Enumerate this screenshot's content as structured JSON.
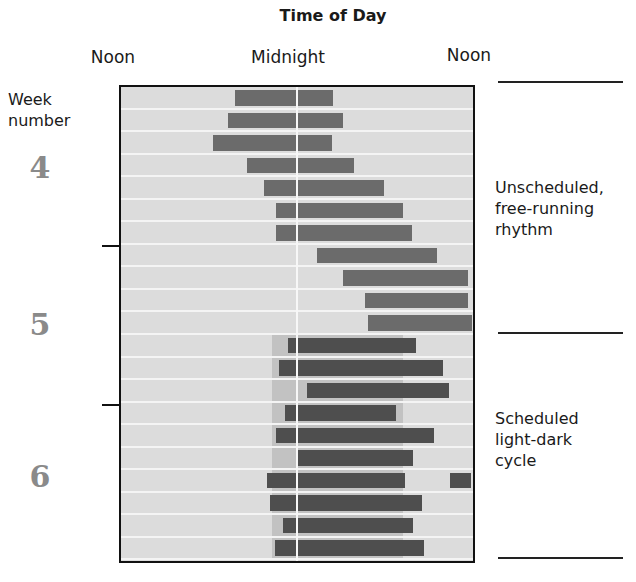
{
  "chart_data": {
    "type": "bar",
    "subtype": "actogram (horizontal range bars)",
    "title": "Time of Day",
    "xlabel": "Time of Day",
    "ylabel": "Week number",
    "x_unit": "hours after left-edge noon (0 = Noon, 12 = Midnight, 24 = Noon)",
    "xlim": [
      0,
      24
    ],
    "x_ticks": [
      {
        "label": "Noon",
        "value": 0
      },
      {
        "label": "Midnight",
        "value": 12
      },
      {
        "label": "Noon",
        "value": 24
      }
    ],
    "week_labels": [
      {
        "label": "4",
        "center_row": 4
      },
      {
        "label": "5",
        "center_row": 11
      },
      {
        "label": "6",
        "center_row": 18
      }
    ],
    "week_boundaries_after_row": [
      7,
      14
    ],
    "grid": "horizontal row separators",
    "midnight_line": true,
    "rows": [
      {
        "row": 1,
        "condition": "unscheduled",
        "bars": [
          [
            7.8,
            14.5
          ]
        ]
      },
      {
        "row": 2,
        "condition": "unscheduled",
        "bars": [
          [
            7.3,
            15.2
          ]
        ]
      },
      {
        "row": 3,
        "condition": "unscheduled",
        "bars": [
          [
            6.3,
            14.4
          ]
        ]
      },
      {
        "row": 4,
        "condition": "unscheduled",
        "bars": [
          [
            8.6,
            15.9
          ]
        ]
      },
      {
        "row": 5,
        "condition": "unscheduled",
        "bars": [
          [
            9.8,
            18.0
          ]
        ]
      },
      {
        "row": 6,
        "condition": "unscheduled",
        "bars": [
          [
            10.6,
            19.3
          ]
        ]
      },
      {
        "row": 7,
        "condition": "unscheduled",
        "bars": [
          [
            10.6,
            19.9
          ]
        ]
      },
      {
        "row": 8,
        "condition": "unscheduled",
        "bars": [
          [
            13.4,
            21.6
          ]
        ]
      },
      {
        "row": 9,
        "condition": "unscheduled",
        "bars": [
          [
            15.2,
            23.7
          ]
        ]
      },
      {
        "row": 10,
        "condition": "unscheduled",
        "bars": [
          [
            16.7,
            23.7
          ]
        ]
      },
      {
        "row": 11,
        "condition": "unscheduled",
        "bars": [
          [
            16.9,
            24.0
          ]
        ]
      },
      {
        "row": 12,
        "condition": "scheduled",
        "bars": [
          [
            11.4,
            20.2
          ]
        ]
      },
      {
        "row": 13,
        "condition": "scheduled",
        "bars": [
          [
            10.8,
            22.0
          ]
        ]
      },
      {
        "row": 14,
        "condition": "scheduled",
        "bars": [
          [
            12.7,
            22.4
          ]
        ]
      },
      {
        "row": 15,
        "condition": "scheduled",
        "bars": [
          [
            11.2,
            18.8
          ]
        ]
      },
      {
        "row": 16,
        "condition": "scheduled",
        "bars": [
          [
            10.6,
            21.4
          ]
        ]
      },
      {
        "row": 17,
        "condition": "scheduled",
        "bars": [
          [
            12.1,
            20.0
          ]
        ]
      },
      {
        "row": 18,
        "condition": "scheduled",
        "bars": [
          [
            10.0,
            19.4
          ],
          [
            22.5,
            23.9
          ]
        ]
      },
      {
        "row": 19,
        "condition": "scheduled",
        "bars": [
          [
            10.2,
            20.6
          ]
        ]
      },
      {
        "row": 20,
        "condition": "scheduled",
        "bars": [
          [
            11.1,
            20.0
          ]
        ]
      },
      {
        "row": 21,
        "condition": "scheduled",
        "bars": [
          [
            10.5,
            20.7
          ]
        ]
      }
    ],
    "scheduled_dark_band": {
      "rows": [
        12,
        21
      ],
      "range": [
        10.3,
        19.3
      ]
    },
    "annotations": [
      {
        "text": "Unscheduled, free-running rhythm",
        "rows": [
          1,
          11
        ]
      },
      {
        "text": "Scheduled light-dark cycle",
        "rows": [
          12,
          21
        ]
      }
    ],
    "colors": {
      "background": "#dcdcdc",
      "bar": "#6b6b6b",
      "bar_in_band": "#4e4e4e",
      "band": "#c2c2c2",
      "week_numbers": "#8a8a8a"
    }
  },
  "labels": {
    "title": "Time of Day",
    "noon_left": "Noon",
    "midnight": "Midnight",
    "noon_right": "Noon",
    "week_line1": "Week",
    "week_line2": "number",
    "week4": "4",
    "week5": "5",
    "week6": "6",
    "unscheduled_1": "Unscheduled,",
    "unscheduled_2": "free-running",
    "unscheduled_3": "rhythm",
    "scheduled_1": "Scheduled",
    "scheduled_2": "light-dark",
    "scheduled_3": "cycle"
  }
}
